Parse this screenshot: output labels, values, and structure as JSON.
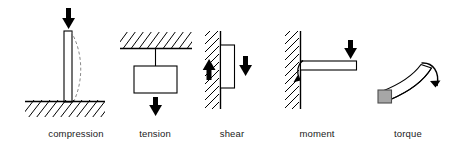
{
  "figure": {
    "background_color": "#ffffff",
    "line_color": "#000000",
    "label_color": "#1a1a1a",
    "fill_color": "#ffffff",
    "torque_face_color": "#a6a6a6"
  },
  "panels": [
    {
      "id": "compression",
      "label": "compression",
      "label_x": 76,
      "icons": {
        "load_arrow": "down-arrow-icon",
        "support": "ground-hatch-icon",
        "member": "vertical-column-icon",
        "deformation": "buckled-dashed-outline-icon"
      }
    },
    {
      "id": "tension",
      "label": "tension",
      "label_x": 155,
      "icons": {
        "load_arrow": "down-arrow-icon",
        "support": "ceiling-hatch-icon",
        "member": "hanging-rod-icon",
        "body": "suspended-block-icon"
      }
    },
    {
      "id": "shear",
      "label": "shear",
      "label_x": 232,
      "icons": {
        "load_arrow": "down-arrow-icon",
        "reaction_arrow": "up-arrow-icon",
        "support": "wall-hatch-icon",
        "body": "attached-block-icon"
      }
    },
    {
      "id": "moment",
      "label": "moment",
      "label_x": 317,
      "icons": {
        "load_arrow": "down-arrow-icon",
        "support": "wall-hatch-icon",
        "member": "cantilever-beam-icon",
        "reaction": "curved-moment-arrow-icon"
      }
    },
    {
      "id": "torque",
      "label": "torque",
      "label_x": 408,
      "icons": {
        "member": "twisted-bar-icon",
        "end_face": "square-end-face-icon",
        "load": "curved-torque-arrow-icon"
      }
    }
  ]
}
